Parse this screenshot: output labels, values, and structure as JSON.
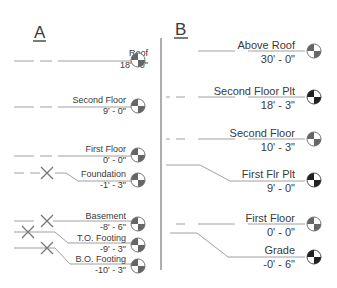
{
  "panels": {
    "a": {
      "label": "A",
      "levels": [
        {
          "name": "Roof",
          "elevation": "18' - 0\""
        },
        {
          "name": "Second Floor",
          "elevation": "9' - 0\""
        },
        {
          "name": "First Floor",
          "elevation": "0' - 0\""
        },
        {
          "name": "Foundation",
          "elevation": "-1' - 3\""
        },
        {
          "name": "Basement",
          "elevation": "-8' - 6\""
        },
        {
          "name": "T.O. Footing",
          "elevation": "-9' - 3\""
        },
        {
          "name": "B.O. Footing",
          "elevation": "-10' - 3\""
        }
      ]
    },
    "b": {
      "label": "B",
      "levels": [
        {
          "name": "Above Roof",
          "elevation": "30' - 0\""
        },
        {
          "name": "Second Floor Plt",
          "elevation": "18' - 3\""
        },
        {
          "name": "Second Floor",
          "elevation": "10' - 3\""
        },
        {
          "name": "First Flr Plt",
          "elevation": "9' - 0\""
        },
        {
          "name": "First Floor",
          "elevation": "0' - 0\""
        },
        {
          "name": "Grade",
          "elevation": "-0' - 6\""
        }
      ]
    }
  }
}
